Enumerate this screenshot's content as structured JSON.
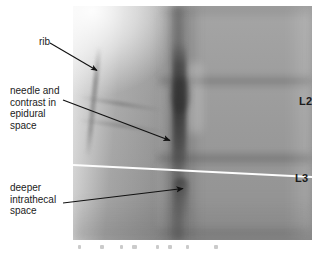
{
  "figure": {
    "type": "annotated-fluoroscopic-radiograph",
    "modality": "fluoroscopy",
    "region": "lumbar spine, lateral view",
    "width": 312,
    "height": 253
  },
  "callouts": [
    {
      "id": "rib",
      "text": "rib",
      "lines": [
        "rib"
      ],
      "align": "right",
      "arrow": {
        "from_x": 50,
        "from_y": 43,
        "to_x": 99,
        "to_y": 72
      }
    },
    {
      "id": "needle-contrast",
      "text": "needle and\ncontrast in\nepidural\nspace",
      "lines": [
        "needle and",
        "contrast in",
        "epidural",
        "space"
      ],
      "align": "left",
      "arrow": {
        "from_x": 63,
        "from_y": 100,
        "to_x": 173,
        "to_y": 142
      }
    },
    {
      "id": "deeper-intrathecal",
      "text": "deeper\nintrathecal\nspace",
      "lines": [
        "deeper",
        "intrathecal",
        "space"
      ],
      "align": "left",
      "arrow": {
        "from_x": 63,
        "from_y": 203,
        "to_x": 186,
        "to_y": 188
      }
    }
  ],
  "image_labels": [
    {
      "id": "l2",
      "text": "L2"
    },
    {
      "id": "l3",
      "text": "L3"
    }
  ],
  "reference_line": {
    "id": "white-level-line",
    "color": "#fdfdfd",
    "description": "horizontal white reference line at L3 level"
  },
  "colors": {
    "background": "#ffffff",
    "text": "#1c1c1c",
    "arrow": "#111111",
    "level_label": "#1b1b1b",
    "reference_line": "#fdfdfd",
    "xray_mid_gray": "#8f8f8f"
  }
}
